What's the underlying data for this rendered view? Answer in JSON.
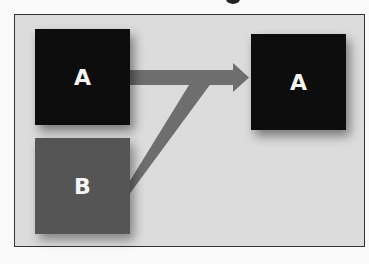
{
  "diagram": {
    "boxes": [
      {
        "id": "source-a",
        "label": "A",
        "color": "#0d0d0d"
      },
      {
        "id": "source-b",
        "label": "B",
        "color": "#555555"
      },
      {
        "id": "target-a",
        "label": "A",
        "color": "#0d0d0d"
      }
    ],
    "arrow_color": "#6e6e6e",
    "frame_background": "#dcdcdc",
    "edges": [
      {
        "from": "source-a",
        "to": "target-a"
      },
      {
        "from": "source-b",
        "to": "target-a",
        "merges_into": "source-a-edge"
      }
    ]
  }
}
